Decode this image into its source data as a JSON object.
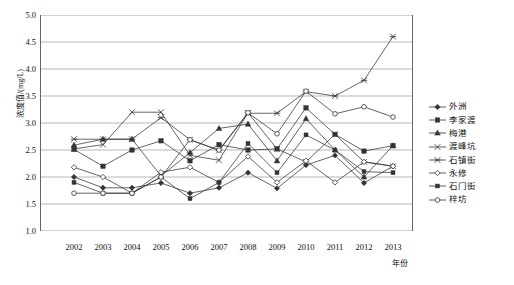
{
  "chart_data": {
    "type": "line",
    "title": "",
    "xlabel": "年份",
    "ylabel": "浓度值/(mg/L)",
    "categories": [
      2002,
      2003,
      2004,
      2005,
      2006,
      2007,
      2008,
      2009,
      2010,
      2011,
      2012,
      2013
    ],
    "x_tick_labels": [
      "2002",
      "2003",
      "2004",
      "2005",
      "2006",
      "2007",
      "2008",
      "2009",
      "2010",
      "2011",
      "2012",
      "2013"
    ],
    "y_tick_labels": [
      "5.0",
      "4.5",
      "4.0",
      "3.5",
      "3.0",
      "2.5",
      "2.0",
      "1.5",
      "1.0"
    ],
    "ylim": [
      1.0,
      5.0
    ],
    "ystep": 0.5,
    "grid": "horizontal",
    "legend_position": "right",
    "series": [
      {
        "name": "外洲",
        "marker": "diamond-filled",
        "values": [
          2.0,
          1.8,
          1.8,
          1.89,
          1.7,
          1.8,
          2.08,
          1.79,
          2.22,
          2.4,
          1.89,
          2.2
        ]
      },
      {
        "name": "李家渡",
        "marker": "square-filled",
        "values": [
          2.51,
          2.2,
          2.5,
          2.67,
          2.3,
          2.6,
          2.5,
          2.52,
          3.28,
          2.79,
          2.48,
          2.58
        ]
      },
      {
        "name": "梅港",
        "marker": "triangle-filled",
        "values": [
          2.59,
          2.7,
          2.7,
          2.02,
          2.45,
          2.9,
          2.98,
          2.3,
          3.08,
          2.5,
          2.0,
          2.58
        ]
      },
      {
        "name": "渡峰坑",
        "marker": "star-x",
        "values": [
          2.52,
          2.6,
          3.2,
          3.2,
          2.4,
          2.31,
          3.19,
          2.52,
          2.28,
          2.79,
          2.28,
          2.2
        ]
      },
      {
        "name": "石镇街",
        "marker": "asterisk",
        "values": [
          2.7,
          2.7,
          2.7,
          3.1,
          2.69,
          2.49,
          3.18,
          3.18,
          3.58,
          3.5,
          3.79,
          4.6
        ]
      },
      {
        "name": "永修",
        "marker": "diamond-open",
        "values": [
          2.18,
          2.0,
          1.7,
          2.09,
          2.18,
          1.9,
          2.38,
          1.9,
          2.3,
          1.9,
          2.28,
          2.2
        ]
      },
      {
        "name": "石门街",
        "marker": "square-small-filled",
        "values": [
          1.9,
          1.7,
          1.7,
          2.0,
          1.6,
          1.9,
          2.62,
          2.08,
          2.78,
          2.5,
          2.1,
          2.08
        ]
      },
      {
        "name": "梓坊",
        "marker": "circle-open",
        "values": [
          1.7,
          1.7,
          1.7,
          2.0,
          2.69,
          2.5,
          3.19,
          2.8,
          3.59,
          3.17,
          3.3,
          3.11
        ]
      }
    ],
    "colors": {
      "line": "#333333",
      "grid": "#999999",
      "axis": "#555555",
      "text": "#111111",
      "background": "#ffffff"
    }
  }
}
